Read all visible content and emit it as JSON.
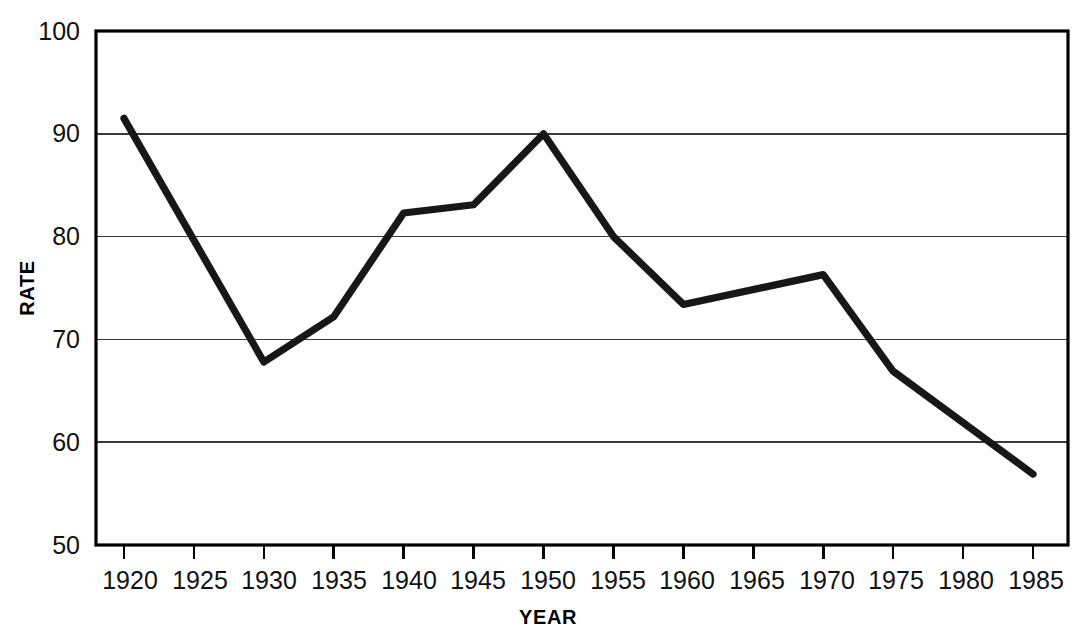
{
  "chart_data": {
    "type": "line",
    "title": "",
    "subtitle": "",
    "xlabel": "YEAR",
    "ylabel": "RATE",
    "xlim": [
      1918,
      1987.5
    ],
    "ylim": [
      50,
      100
    ],
    "grid": "horizontal",
    "legend": "none",
    "xticks": [
      1920,
      1925,
      1930,
      1935,
      1940,
      1945,
      1950,
      1955,
      1960,
      1965,
      1970,
      1975,
      1980,
      1985
    ],
    "xtick_labels": [
      "1920",
      "1925",
      "1930",
      "1935",
      "1940",
      "1945",
      "1950",
      "1955",
      "1960",
      "1965",
      "1970",
      "1975",
      "1980",
      "1985"
    ],
    "yticks": [
      50,
      60,
      70,
      80,
      90,
      100
    ],
    "ytick_labels": [
      "50",
      "60",
      "70",
      "80",
      "90",
      "100"
    ],
    "x": [
      1920,
      1930,
      1935,
      1940,
      1945,
      1950,
      1955,
      1960,
      1970,
      1975,
      1985
    ],
    "values": [
      91.5,
      67.8,
      72.2,
      82.3,
      83.1,
      90.0,
      80.0,
      73.4,
      76.3,
      66.9,
      56.9
    ],
    "series": [
      {
        "name": "RATE",
        "color": "#17171a",
        "points": [
          {
            "x": 1920,
            "y": 91.5
          },
          {
            "x": 1930,
            "y": 67.8
          },
          {
            "x": 1935,
            "y": 72.2
          },
          {
            "x": 1940,
            "y": 82.3
          },
          {
            "x": 1945,
            "y": 83.1
          },
          {
            "x": 1950,
            "y": 90.0
          },
          {
            "x": 1955,
            "y": 80.0
          },
          {
            "x": 1960,
            "y": 73.4
          },
          {
            "x": 1970,
            "y": 76.3
          },
          {
            "x": 1975,
            "y": 66.9
          },
          {
            "x": 1985,
            "y": 56.9
          }
        ]
      }
    ]
  },
  "axes": {
    "x_title": "YEAR",
    "y_title": "RATE"
  },
  "ylabels": {
    "t0": "50",
    "t1": "60",
    "t2": "70",
    "t3": "80",
    "t4": "90",
    "t5": "100"
  },
  "xlabels": {
    "t0": "1920",
    "t1": "1925",
    "t2": "1930",
    "t3": "1935",
    "t4": "1940",
    "t5": "1945",
    "t6": "1950",
    "t7": "1955",
    "t8": "1960",
    "t9": "1965",
    "t10": "1970",
    "t11": "1975",
    "t12": "1980",
    "t13": "1985"
  },
  "colors": {
    "line": "#17171a",
    "grid": "#3a3a3a",
    "frame": "#000000",
    "background": "#ffffff"
  }
}
